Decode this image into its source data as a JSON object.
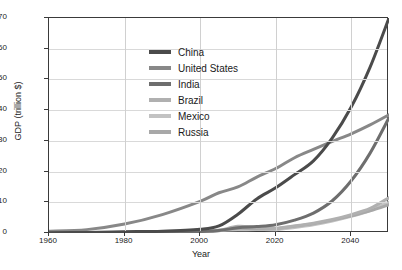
{
  "chart_data": {
    "type": "line",
    "title": "",
    "xlabel": "Year",
    "ylabel": "GDP (trillion $)",
    "xlim": [
      1960,
      2050
    ],
    "ylim": [
      0,
      70
    ],
    "xticks": [
      1960,
      1980,
      2000,
      2020,
      2040
    ],
    "yticks": [
      0,
      10,
      20,
      30,
      40,
      50,
      60,
      70
    ],
    "grid": true,
    "legend_position": "upper-center-left",
    "x": [
      1960,
      1970,
      1980,
      1990,
      2000,
      2005,
      2010,
      2015,
      2020,
      2025,
      2030,
      2035,
      2040,
      2045,
      2050
    ],
    "series": [
      {
        "name": "China",
        "color": "#4b4b4b",
        "values": [
          0.1,
          0.2,
          0.4,
          0.6,
          1.2,
          2.3,
          6.1,
          11.1,
          14.7,
          19.0,
          23.5,
          31.0,
          41.0,
          54.0,
          70.0
        ]
      },
      {
        "name": "United States",
        "color": "#888888",
        "values": [
          0.6,
          1.1,
          2.9,
          6.0,
          10.3,
          13.1,
          15.0,
          18.2,
          21.0,
          24.5,
          27.2,
          29.8,
          32.3,
          35.2,
          38.5
        ]
      },
      {
        "name": "India",
        "color": "#6e6e6e",
        "values": [
          0.04,
          0.06,
          0.19,
          0.32,
          0.47,
          0.82,
          1.7,
          2.1,
          2.7,
          4.2,
          6.5,
          10.5,
          17.0,
          26.0,
          37.5
        ]
      },
      {
        "name": "Brazil",
        "color": "#b0b0b0",
        "values": [
          0.02,
          0.04,
          0.15,
          0.46,
          0.65,
          0.89,
          2.2,
          1.8,
          1.5,
          2.3,
          3.2,
          4.4,
          6.0,
          8.0,
          11.5
        ]
      },
      {
        "name": "Mexico",
        "color": "#c2c2c2",
        "values": [
          0.01,
          0.04,
          0.21,
          0.29,
          0.71,
          0.88,
          1.06,
          1.17,
          1.09,
          1.8,
          2.7,
          3.9,
          5.4,
          7.3,
          10.0
        ]
      },
      {
        "name": "Russia",
        "color": "#a8a8a8",
        "values": [
          0.02,
          0.05,
          0.18,
          0.51,
          0.26,
          0.76,
          1.52,
          1.36,
          1.48,
          2.2,
          3.0,
          4.2,
          5.6,
          7.2,
          9.2
        ]
      }
    ]
  },
  "axes": {
    "y_title": "GDP (trillion $)",
    "x_title": "Year",
    "y_tick_labels": [
      "0",
      "10",
      "20",
      "30",
      "40",
      "50",
      "60",
      "70"
    ],
    "x_tick_labels": [
      "1960",
      "1980",
      "2000",
      "2020",
      "2040"
    ]
  },
  "legend": {
    "entries": [
      {
        "label": "China",
        "color": "#4b4b4b"
      },
      {
        "label": "United States",
        "color": "#888888"
      },
      {
        "label": "India",
        "color": "#6e6e6e"
      },
      {
        "label": "Brazil",
        "color": "#b0b0b0"
      },
      {
        "label": "Mexico",
        "color": "#c2c2c2"
      },
      {
        "label": "Russia",
        "color": "#a8a8a8"
      }
    ]
  }
}
